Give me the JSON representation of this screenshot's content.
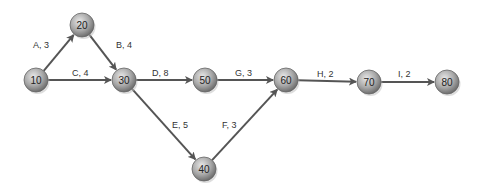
{
  "nodes": [
    {
      "id": "10",
      "x": 36,
      "y": 80
    },
    {
      "id": "20",
      "x": 82,
      "y": 25
    },
    {
      "id": "30",
      "x": 124,
      "y": 80
    },
    {
      "id": "40",
      "x": 204,
      "y": 169
    },
    {
      "id": "50",
      "x": 205,
      "y": 80
    },
    {
      "id": "60",
      "x": 286,
      "y": 80
    },
    {
      "id": "70",
      "x": 369,
      "y": 82
    },
    {
      "id": "80",
      "x": 447,
      "y": 82
    }
  ],
  "edges": [
    {
      "from": "10",
      "to": "20",
      "label": "A, 3",
      "lx": 33,
      "ly": 48
    },
    {
      "from": "20",
      "to": "30",
      "label": "B, 4",
      "lx": 116,
      "ly": 48
    },
    {
      "from": "10",
      "to": "30",
      "label": "C, 4",
      "lx": 72,
      "ly": 76
    },
    {
      "from": "30",
      "to": "50",
      "label": "D, 8",
      "lx": 152,
      "ly": 76
    },
    {
      "from": "30",
      "to": "40",
      "label": "E, 5",
      "lx": 172,
      "ly": 128
    },
    {
      "from": "50",
      "to": "60",
      "label": "G, 3",
      "lx": 235,
      "ly": 76
    },
    {
      "from": "40",
      "to": "60",
      "label": "F, 3",
      "lx": 222,
      "ly": 128
    },
    {
      "from": "60",
      "to": "70",
      "label": "H, 2",
      "lx": 317,
      "ly": 77
    },
    {
      "from": "70",
      "to": "80",
      "label": "I, 2",
      "lx": 398,
      "ly": 77
    }
  ]
}
